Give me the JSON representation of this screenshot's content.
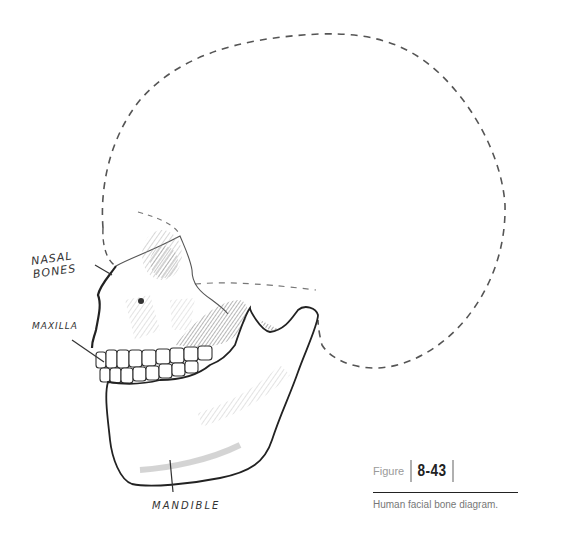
{
  "diagram": {
    "title": "Human facial bone diagram",
    "labels": {
      "nasal_line1": "NASAL",
      "nasal_line2": "BONES",
      "maxilla": "MAXILLA",
      "mandible": "MANDIBLE"
    },
    "colors": {
      "stroke": "#333333",
      "dashed": "#555555",
      "shade": "#999999"
    }
  },
  "figure": {
    "word": "Figure",
    "number": "8-43",
    "caption": "Human facial bone diagram."
  }
}
